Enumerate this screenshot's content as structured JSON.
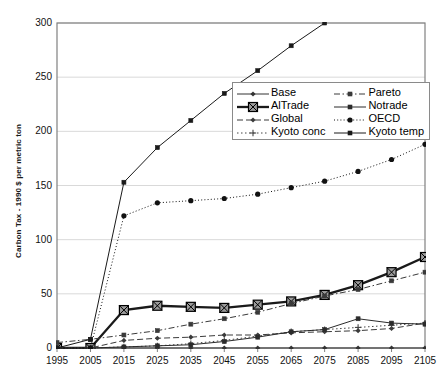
{
  "chart_data": {
    "type": "line",
    "title": "",
    "xlabel": "",
    "ylabel": "Carbon Tax - 1990 $ per metric ton",
    "x": [
      1995,
      2005,
      2015,
      2025,
      2035,
      2045,
      2055,
      2065,
      2075,
      2085,
      2095,
      2105
    ],
    "xlim": [
      1995,
      2105
    ],
    "ylim": [
      0,
      300
    ],
    "ytick_labels": [
      "0",
      "50",
      "100",
      "150",
      "200",
      "250",
      "300"
    ],
    "yticks": [
      0,
      50,
      100,
      150,
      200,
      250,
      300
    ],
    "xtick_labels": [
      "1995",
      "2005",
      "2015",
      "2025",
      "2035",
      "2045",
      "2055",
      "2065",
      "2075",
      "2085",
      "2095",
      "2105"
    ],
    "grid": "horizontal",
    "legend_position": "upper-center-right",
    "series": [
      {
        "name": "Base",
        "style": "solid-thin",
        "marker": "small-diamond",
        "color": "#333333",
        "values": [
          0,
          0,
          0,
          0,
          0,
          0,
          0,
          0,
          0,
          0,
          0,
          0
        ]
      },
      {
        "name": "AlTrade",
        "style": "solid-thick",
        "marker": "large-square-x",
        "color": "#1a1a1a",
        "values": [
          0,
          0,
          35,
          39,
          38,
          37,
          40,
          43,
          49,
          58,
          70,
          84
        ]
      },
      {
        "name": "Global",
        "style": "dashed",
        "marker": "small-diamond",
        "color": "#3a3a3a",
        "values": [
          0,
          0,
          7,
          9,
          10,
          12,
          12,
          14,
          15,
          16,
          18,
          23
        ]
      },
      {
        "name": "Kyoto conc",
        "style": "dotted",
        "marker": "plus",
        "color": "#444444",
        "values": [
          0,
          0,
          1,
          2,
          4,
          7,
          11,
          15,
          17,
          19,
          21,
          23
        ]
      },
      {
        "name": "Pareto",
        "style": "dash-dot",
        "marker": "small-square",
        "color": "#3a3a3a",
        "values": [
          5,
          8,
          12,
          16,
          22,
          27,
          33,
          41,
          48,
          54,
          62,
          70
        ]
      },
      {
        "name": "Notrade",
        "style": "solid-thin",
        "marker": "small-square",
        "color": "#2b2b2b",
        "values": [
          0,
          0,
          1,
          2,
          3,
          6,
          10,
          15,
          17,
          27,
          23,
          22
        ]
      },
      {
        "name": "OECD",
        "style": "dotted-round",
        "marker": "round-dot",
        "color": "#111111",
        "values": [
          0,
          0,
          122,
          134,
          136,
          138,
          142,
          148,
          154,
          163,
          174,
          188
        ]
      },
      {
        "name": "Kyoto temp",
        "style": "solid-thin",
        "marker": "small-square",
        "color": "#1a1a1a",
        "values": [
          0,
          8,
          153,
          185,
          210,
          235,
          256,
          279,
          301,
          null,
          null,
          null
        ]
      }
    ]
  },
  "legend": {
    "entries": [
      {
        "label": "Base"
      },
      {
        "label": "Pareto"
      },
      {
        "label": "AlTrade"
      },
      {
        "label": "Notrade"
      },
      {
        "label": "Global"
      },
      {
        "label": "OECD"
      },
      {
        "label": "Kyoto conc"
      },
      {
        "label": "Kyoto temp"
      }
    ]
  },
  "colors": {
    "axis": "#808080",
    "grid": "#d9d9d9",
    "text": "#111111",
    "plot_bg": "#ffffff"
  }
}
